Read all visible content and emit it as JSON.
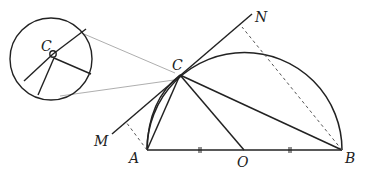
{
  "diagram": {
    "points": {
      "A": {
        "label": "A",
        "x": 147,
        "y": 150
      },
      "B": {
        "label": "B",
        "x": 342,
        "y": 150
      },
      "O": {
        "label": "O",
        "x": 244,
        "y": 150
      },
      "C": {
        "label": "C",
        "x": 180,
        "y": 75
      },
      "M": {
        "label": "M",
        "x": 112,
        "y": 134
      },
      "N": {
        "label": "N",
        "x": 252,
        "y": 14
      }
    },
    "magnifier": {
      "label": "C",
      "cx": 51,
      "cy": 59,
      "r": 41
    },
    "colors": {
      "stroke": "#222222",
      "dashed": "#555555",
      "thin": "#888888"
    }
  }
}
